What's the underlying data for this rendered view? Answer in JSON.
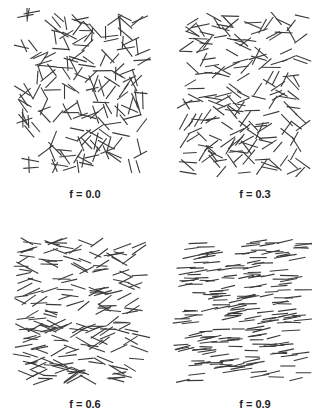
{
  "figure": {
    "panels": [
      {
        "id": "p1",
        "label": "f = 0.0",
        "order": 0.0,
        "box": [
          12,
          8,
          140,
          165
        ],
        "label_pos": [
          45,
          188
        ],
        "count": 190,
        "seed": 11
      },
      {
        "id": "p2",
        "label": "f = 0.3",
        "order": 0.3,
        "box": [
          175,
          12,
          137,
          165
        ],
        "label_pos": [
          215,
          188
        ],
        "count": 190,
        "seed": 23
      },
      {
        "id": "p3",
        "label": "f = 0.6",
        "order": 0.6,
        "box": [
          12,
          236,
          138,
          150
        ],
        "label_pos": [
          45,
          398
        ],
        "count": 200,
        "seed": 37
      },
      {
        "id": "p4",
        "label": "f = 0.9",
        "order": 0.9,
        "box": [
          172,
          236,
          140,
          150
        ],
        "label_pos": [
          215,
          398
        ],
        "count": 210,
        "seed": 53
      }
    ],
    "segment_length": 16,
    "line_color": "#3a3a3a"
  }
}
